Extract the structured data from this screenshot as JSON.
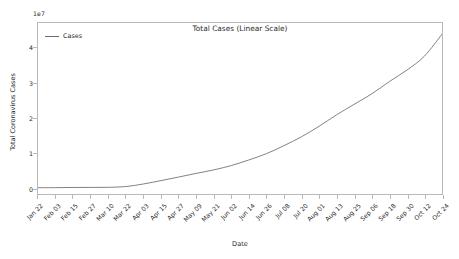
{
  "chart_data": {
    "type": "line",
    "title": "Total Cases (Linear Scale)",
    "xlabel": "Date",
    "ylabel": "Total Coronavirus Cases",
    "y_offset_text": "1e7",
    "y_offset_multiplier": 10000000,
    "grid": false,
    "legend_position": "upper left",
    "line_color": "#6b6b6b",
    "axes_color": "#b9b9b9",
    "text_color": "#2b2b2b",
    "background_color": "#ffffff",
    "ylim": [
      -0.18,
      4.72
    ],
    "ytick_labels": [
      "0",
      "1",
      "2",
      "3",
      "4"
    ],
    "ytick_values": [
      0,
      1,
      2,
      3,
      4
    ],
    "categories": [
      "Jan 22",
      "Feb 03",
      "Feb 15",
      "Feb 27",
      "Mar 10",
      "Mar 22",
      "Apr 03",
      "Apr 15",
      "Apr 27",
      "May 09",
      "May 21",
      "Jun 02",
      "Jun 14",
      "Jun 26",
      "Jul 08",
      "Jul 20",
      "Aug 01",
      "Aug 13",
      "Aug 25",
      "Sep 06",
      "Sep 18",
      "Sep 30",
      "Oct 12",
      "Oct 24"
    ],
    "series": [
      {
        "name": "Cases",
        "values": [
          0.0006,
          0.0019,
          0.0069,
          0.0083,
          0.0118,
          0.0335,
          0.107,
          0.204,
          0.305,
          0.41,
          0.51,
          0.635,
          0.795,
          0.975,
          1.205,
          1.46,
          1.76,
          2.09,
          2.39,
          2.69,
          3.04,
          3.37,
          3.77,
          4.4
        ]
      }
    ],
    "xtick_count": 24,
    "x_range_label_first": "Jan 22",
    "x_range_label_last": "Oct 24"
  }
}
